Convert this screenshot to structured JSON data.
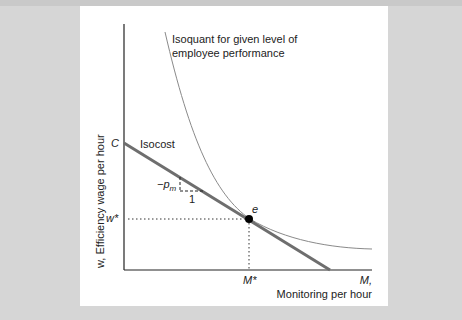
{
  "figure": {
    "y_axis_label": "w, Efficiency wage per hour",
    "x_axis_var": "M,",
    "x_axis_label": "Monitoring per hour",
    "intercept_label": "C",
    "isocost_label": "Isocost",
    "isoquant_label_line1": "Isoquant for given level of",
    "isoquant_label_line2": "employee performance",
    "slope_label": "−p",
    "slope_subscript": "m",
    "run_label": "1",
    "equilibrium_label": "e",
    "w_star_label": "w*",
    "m_star_label": "M*"
  },
  "colors": {
    "background": "#d6d6d6",
    "panel": "#ffffff",
    "axis": "#222222",
    "isocost": "#6e6e6e",
    "isoquant": "#8a8a8a",
    "point": "#000000"
  }
}
